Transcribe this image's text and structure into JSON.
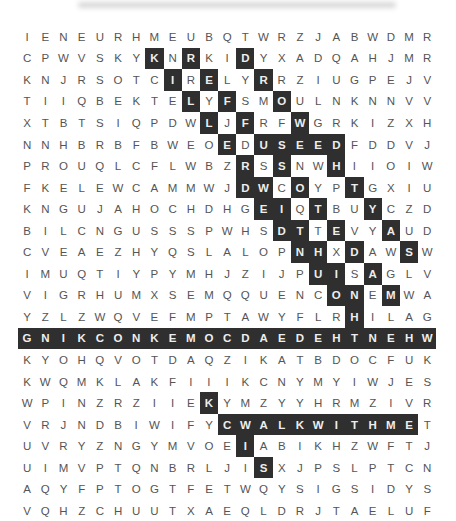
{
  "puzzle": {
    "rows": [
      "IENEURHMEUBQTWRZJABWDMR",
      "CPWVSKYKNRKIDYXADQAHJMR",
      "KNJRSOTCIRELYRRZIUGPEJV",
      "TIIQBEKTELYFSMOULNKNNVV",
      "XTBTSIQPDWLJFRFWGRKIZXH",
      "NNHBRBFBWEOEDUSEEDFDDVJ",
      "PROUQLCFLWBZRSSNWHIIOIW",
      "FKELEWCAMMWJDWCOYPTGXIU",
      "KNGUJAHOCHDHGEIQTBUYCZD",
      "BILCNGUSSSPWHSDTTEVYAUD",
      "CVEAEZHYQSLALOPNHXDAWSW",
      "IMUQTIYPYMHJZIJPUISAGLV",
      "VIGRHUMXSEMQQUENCONEMWA",
      "YZLZWQVEFMPTAWYFLRHILAG",
      "GNIKCONKEMOCDAEDEHTNEHW",
      "KYOHQVOTDAQZIKATBDOCFUK",
      "KWQMKLAKFIIIKCNYMYIWJES",
      "WPINZRZIIEKYMZYYHRMZIVR",
      "VRJNDBIWIFYCWALKWITHMET",
      "UVRYZNGYMVOEIABIKHZWFTJ",
      "UIMVPTQNBRLJISXJPSLPTCN",
      "AQYFPTOGTFETWQYSIGSIDYS",
      "VQHZCHUUTXAEQLDRJTAELUF"
    ],
    "highlighted": [
      [
        1,
        7
      ],
      [
        1,
        9
      ],
      [
        1,
        12
      ],
      [
        2,
        8
      ],
      [
        2,
        10
      ],
      [
        2,
        13
      ],
      [
        3,
        9
      ],
      [
        3,
        11
      ],
      [
        3,
        14
      ],
      [
        4,
        10
      ],
      [
        4,
        12
      ],
      [
        4,
        15
      ],
      [
        5,
        11
      ],
      [
        5,
        13
      ],
      [
        5,
        14
      ],
      [
        5,
        15
      ],
      [
        5,
        16
      ],
      [
        5,
        17
      ],
      [
        6,
        12
      ],
      [
        6,
        14
      ],
      [
        6,
        17
      ],
      [
        7,
        12
      ],
      [
        7,
        13
      ],
      [
        7,
        15
      ],
      [
        7,
        18
      ],
      [
        8,
        13
      ],
      [
        8,
        14
      ],
      [
        8,
        16
      ],
      [
        8,
        19
      ],
      [
        9,
        14
      ],
      [
        9,
        15
      ],
      [
        9,
        17
      ],
      [
        9,
        20
      ],
      [
        10,
        15
      ],
      [
        10,
        16
      ],
      [
        10,
        18
      ],
      [
        10,
        21
      ],
      [
        11,
        16
      ],
      [
        11,
        17
      ],
      [
        11,
        19
      ],
      [
        12,
        17
      ],
      [
        12,
        18
      ],
      [
        12,
        20
      ],
      [
        13,
        18
      ],
      [
        14,
        0
      ],
      [
        14,
        1
      ],
      [
        14,
        2
      ],
      [
        14,
        3
      ],
      [
        14,
        4
      ],
      [
        14,
        5
      ],
      [
        14,
        6
      ],
      [
        14,
        7
      ],
      [
        14,
        8
      ],
      [
        14,
        9
      ],
      [
        14,
        10
      ],
      [
        14,
        11
      ],
      [
        14,
        12
      ],
      [
        14,
        13
      ],
      [
        14,
        14
      ],
      [
        14,
        15
      ],
      [
        14,
        16
      ],
      [
        14,
        17
      ],
      [
        14,
        18
      ],
      [
        14,
        19
      ],
      [
        14,
        20
      ],
      [
        14,
        21
      ],
      [
        14,
        22
      ],
      [
        17,
        10
      ],
      [
        18,
        11
      ],
      [
        18,
        12
      ],
      [
        18,
        13
      ],
      [
        18,
        14
      ],
      [
        18,
        15
      ],
      [
        18,
        16
      ],
      [
        18,
        17
      ],
      [
        18,
        18
      ],
      [
        18,
        19
      ],
      [
        18,
        20
      ],
      [
        18,
        21
      ],
      [
        19,
        12
      ],
      [
        20,
        13
      ]
    ],
    "highlight_color": "#2f2f2f"
  }
}
